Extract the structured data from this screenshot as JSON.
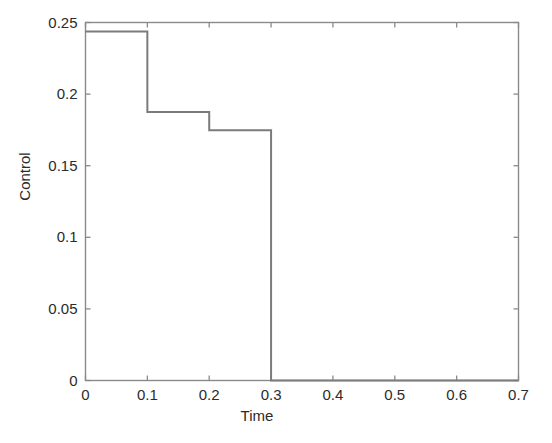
{
  "figure": {
    "background_color": "#ffffff",
    "axis_color": "#8a8a8a",
    "line_color": "#7b7b7b",
    "text_color": "#2b2b2b"
  },
  "chart_data": {
    "type": "line",
    "subtype": "step-post",
    "title": "",
    "xlabel": "Time",
    "ylabel": "Control",
    "xlim": [
      0,
      0.7
    ],
    "ylim": [
      0,
      0.25
    ],
    "grid": false,
    "legend": null,
    "xticks": [
      0,
      0.1,
      0.2,
      0.3,
      0.4,
      0.5,
      0.6,
      0.7
    ],
    "xtick_labels": [
      "0",
      "0.1",
      "0.2",
      "0.3",
      "0.4",
      "0.5",
      "0.6",
      "0.7"
    ],
    "yticks": [
      0,
      0.05,
      0.1,
      0.15,
      0.2,
      0.25
    ],
    "ytick_labels": [
      "0",
      "0.05",
      "0.1",
      "0.15",
      "0.2",
      "0.25"
    ],
    "series": [
      {
        "name": "Control",
        "color": "#7b7b7b",
        "line_width": 2,
        "x": [
          0,
          0.1,
          0.2,
          0.3,
          0.7
        ],
        "y": [
          0.2437,
          0.1875,
          0.1748,
          0.0,
          0.0
        ],
        "steps": [
          {
            "t_start": 0,
            "t_end": 0.1,
            "value": 0.2437
          },
          {
            "t_start": 0.1,
            "t_end": 0.2,
            "value": 0.1875
          },
          {
            "t_start": 0.2,
            "t_end": 0.3,
            "value": 0.1748
          },
          {
            "t_start": 0.3,
            "t_end": 0.7,
            "value": 0.0
          }
        ]
      }
    ]
  }
}
